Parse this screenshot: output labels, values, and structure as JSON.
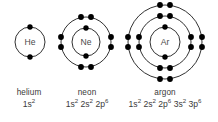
{
  "figure": {
    "background_color": "#ffffff",
    "ring_color": "#1a1a1a",
    "electron_color": "#000000",
    "label_color": "#3a3a3a",
    "symbol_color": "#4a4a4a"
  },
  "atoms": [
    {
      "id": "helium",
      "symbol": "He",
      "name": "helium",
      "config_parts": [
        {
          "orbital": "1s",
          "count": "2"
        }
      ],
      "center": {
        "x": 30,
        "y": 42
      },
      "shells": [
        {
          "radius": 15,
          "electrons": 2,
          "positions": [
            "top-single",
            "bottom-single"
          ]
        }
      ],
      "total_electrons": 2
    },
    {
      "id": "neon",
      "symbol": "Ne",
      "name": "neon",
      "config_parts": [
        {
          "orbital": "1s",
          "count": "2"
        },
        {
          "orbital": "2s",
          "count": "2"
        },
        {
          "orbital": "2p",
          "count": "6"
        }
      ],
      "center": {
        "x": 86,
        "y": 42
      },
      "shells": [
        {
          "radius": 14,
          "electrons": 2,
          "positions": [
            "top-single",
            "bottom-single"
          ]
        },
        {
          "radius": 25,
          "electrons": 8,
          "positions": [
            "top-pair",
            "bottom-pair",
            "left-pair",
            "right-pair"
          ]
        }
      ],
      "total_electrons": 10
    },
    {
      "id": "argon",
      "symbol": "Ar",
      "name": "argon",
      "config_parts": [
        {
          "orbital": "1s",
          "count": "2"
        },
        {
          "orbital": "2s",
          "count": "2"
        },
        {
          "orbital": "2p",
          "count": "6"
        },
        {
          "orbital": "3s",
          "count": "2"
        },
        {
          "orbital": "3p",
          "count": "6"
        }
      ],
      "center": {
        "x": 165,
        "y": 42
      },
      "shells": [
        {
          "radius": 15,
          "electrons": 2,
          "positions": [
            "top-single",
            "bottom-single"
          ]
        },
        {
          "radius": 26,
          "electrons": 8,
          "positions": [
            "top-pair",
            "bottom-pair",
            "left-pair",
            "right-pair"
          ]
        },
        {
          "radius": 37,
          "electrons": 8,
          "positions": [
            "top-pair",
            "bottom-pair",
            "left-pair",
            "right-pair"
          ]
        }
      ],
      "total_electrons": 18
    }
  ],
  "captions": {
    "helium": {
      "name": "helium",
      "config": "1s2"
    },
    "neon": {
      "name": "neon",
      "config": "1s2 2s2 2p6"
    },
    "argon": {
      "name": "argon",
      "config": "1s2 2s2 2p6 3s2 3p6"
    }
  }
}
